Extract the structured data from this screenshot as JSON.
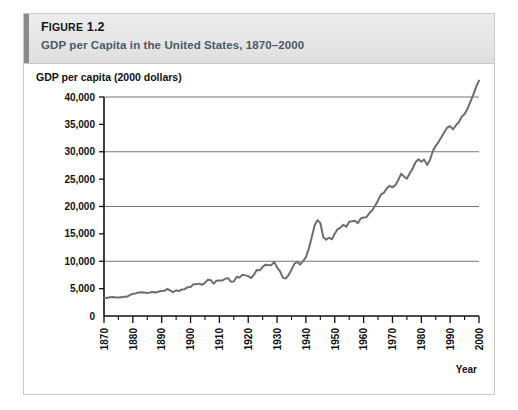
{
  "figure": {
    "number_prefix": "F",
    "number_rest": "IGURE",
    "number": "1.2",
    "title": "GDP per Capita in the United States, 1870–2000"
  },
  "colors": {
    "line": "#6e6e6e",
    "grid": "#767676",
    "axis": "#111111",
    "header_bg": "#e8e8e8",
    "header_accent": "#8a8a8a",
    "title_text": "#4a5a66",
    "card_border": "#c9c9c9"
  },
  "chart_data": {
    "type": "line",
    "title": "GDP per Capita in the United States, 1870–2000",
    "xlabel": "Year",
    "ylabel": "GDP per capita (2000 dollars)",
    "xlim": [
      1870,
      2000
    ],
    "ylim": [
      0,
      40000
    ],
    "grid": true,
    "gridlines_y": [
      10000,
      20000,
      30000,
      40000
    ],
    "legend": null,
    "y_ticks": [
      0,
      5000,
      10000,
      15000,
      20000,
      25000,
      30000,
      35000,
      40000
    ],
    "y_tick_labels": [
      "0",
      "5,000",
      "10,000",
      "15,000",
      "20,000",
      "25,000",
      "30,000",
      "35,000",
      "40,000"
    ],
    "x_ticks": [
      1870,
      1880,
      1890,
      1900,
      1910,
      1920,
      1930,
      1940,
      1950,
      1960,
      1970,
      1980,
      1990,
      2000
    ],
    "x_tick_labels": [
      "1870",
      "1880",
      "1890",
      "1900",
      "1910",
      "1920",
      "1930",
      "1940",
      "1950",
      "1960",
      "1970",
      "1980",
      "1990",
      "2000"
    ],
    "x_minor_ticks": [
      1875,
      1885,
      1895,
      1905,
      1915,
      1925,
      1935,
      1945,
      1955,
      1965,
      1975,
      1985,
      1995
    ],
    "series": [
      {
        "name": "GDP per capita (2000 dollars)",
        "x": [
          1870,
          1871,
          1872,
          1873,
          1874,
          1875,
          1876,
          1877,
          1878,
          1879,
          1880,
          1881,
          1882,
          1883,
          1884,
          1885,
          1886,
          1887,
          1888,
          1889,
          1890,
          1891,
          1892,
          1893,
          1894,
          1895,
          1896,
          1897,
          1898,
          1899,
          1900,
          1901,
          1902,
          1903,
          1904,
          1905,
          1906,
          1907,
          1908,
          1909,
          1910,
          1911,
          1912,
          1913,
          1914,
          1915,
          1916,
          1917,
          1918,
          1919,
          1920,
          1921,
          1922,
          1923,
          1924,
          1925,
          1926,
          1927,
          1928,
          1929,
          1930,
          1931,
          1932,
          1933,
          1934,
          1935,
          1936,
          1937,
          1938,
          1939,
          1940,
          1941,
          1942,
          1943,
          1944,
          1945,
          1946,
          1947,
          1948,
          1949,
          1950,
          1951,
          1952,
          1953,
          1954,
          1955,
          1956,
          1957,
          1958,
          1959,
          1960,
          1961,
          1962,
          1963,
          1964,
          1965,
          1966,
          1967,
          1968,
          1969,
          1970,
          1971,
          1972,
          1973,
          1974,
          1975,
          1976,
          1977,
          1978,
          1979,
          1980,
          1981,
          1982,
          1983,
          1984,
          1985,
          1986,
          1987,
          1988,
          1989,
          1990,
          1991,
          1992,
          1993,
          1994,
          1995,
          1996,
          1997,
          1998,
          1999,
          2000
        ],
        "values": [
          3320,
          3290,
          3430,
          3470,
          3400,
          3370,
          3440,
          3500,
          3520,
          3820,
          4080,
          4130,
          4290,
          4320,
          4280,
          4180,
          4320,
          4390,
          4280,
          4470,
          4560,
          4620,
          4960,
          4640,
          4340,
          4700,
          4540,
          4860,
          4900,
          5260,
          5280,
          5780,
          5800,
          5910,
          5700,
          6040,
          6620,
          6570,
          5890,
          6460,
          6480,
          6470,
          6800,
          6920,
          6270,
          6310,
          7160,
          7000,
          7550,
          7420,
          7280,
          6930,
          7580,
          8420,
          8340,
          8970,
          9380,
          9320,
          9290,
          9880,
          8850,
          8180,
          7010,
          6830,
          7500,
          8460,
          9520,
          9900,
          9390,
          10030,
          10730,
          12310,
          14330,
          16530,
          17500,
          16990,
          14410,
          13940,
          14300,
          14010,
          15020,
          15880,
          16150,
          16660,
          16290,
          17220,
          17290,
          17390,
          16930,
          17800,
          17990,
          18050,
          18800,
          19320,
          20130,
          21110,
          22200,
          22490,
          23300,
          23770,
          23500,
          23900,
          24840,
          25970,
          25480,
          25080,
          26070,
          26920,
          28080,
          28630,
          28170,
          28560,
          27600,
          28480,
          30140,
          31080,
          31810,
          32680,
          33620,
          34430,
          34680,
          34100,
          34840,
          35400,
          36400,
          36910,
          37840,
          39100,
          40400,
          41850,
          43000
        ],
        "color": "#6e6e6e",
        "width": 2
      }
    ]
  }
}
